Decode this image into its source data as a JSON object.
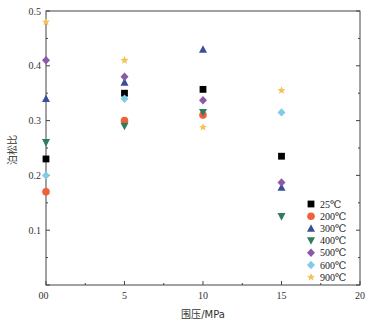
{
  "chart_data": {
    "type": "scatter",
    "title": "",
    "xlabel": "围压/MPa",
    "ylabel": "泊松比",
    "xlim": [
      0,
      20
    ],
    "ylim": [
      0,
      0.5
    ],
    "xticks": [
      "0",
      "5",
      "10",
      "15",
      "20"
    ],
    "yticks": [
      "0.1",
      "0.2",
      "0.3",
      "0.4",
      "0.5"
    ],
    "grid": false,
    "legend_position": "bottom-right",
    "x": [
      0,
      5,
      10,
      15
    ],
    "series": [
      {
        "name": "25℃",
        "marker": "square",
        "color": "#000000",
        "values": [
          0.23,
          0.35,
          0.357,
          0.235
        ]
      },
      {
        "name": "200℃",
        "marker": "circle",
        "color": "#f0603c",
        "values": [
          0.17,
          0.3,
          0.31,
          null
        ]
      },
      {
        "name": "300℃",
        "marker": "triangle-up",
        "color": "#3c4e96",
        "values": [
          0.34,
          0.37,
          0.43,
          0.178
        ]
      },
      {
        "name": "400℃",
        "marker": "triangle-down",
        "color": "#2e7d5b",
        "values": [
          0.26,
          0.29,
          0.315,
          0.125
        ]
      },
      {
        "name": "500℃",
        "marker": "diamond",
        "color": "#8a5aa8",
        "values": [
          0.41,
          0.38,
          0.337,
          0.187
        ]
      },
      {
        "name": "600℃",
        "marker": "diamond",
        "color": "#7fcbe8",
        "values": [
          0.2,
          0.34,
          null,
          0.315
        ]
      },
      {
        "name": "900℃",
        "marker": "star",
        "color": "#f5c15a",
        "values": [
          0.48,
          0.41,
          0.288,
          0.355
        ]
      }
    ]
  }
}
